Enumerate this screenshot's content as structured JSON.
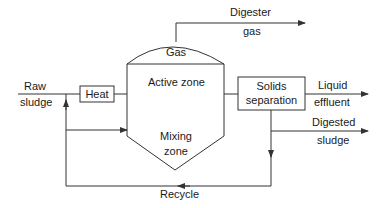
{
  "diagram": {
    "inputs": {
      "raw_sludge_line1": "Raw",
      "raw_sludge_line2": "sludge"
    },
    "boxes": {
      "heat": "Heat",
      "solids_line1": "Solids",
      "solids_line2": "separation"
    },
    "digester": {
      "gas": "Gas",
      "active_zone": "Active zone",
      "mixing_line1": "Mixing",
      "mixing_line2": "zone"
    },
    "outputs": {
      "digester_gas_line1": "Digester",
      "digester_gas_line2": "gas",
      "liquid_line1": "Liquid",
      "liquid_line2": "effluent",
      "digested_line1": "Digested",
      "digested_line2": "sludge"
    },
    "recycle": "Recycle",
    "colors": {
      "line": "#333333",
      "text": "#1a1a1a",
      "background": "#ffffff"
    }
  }
}
